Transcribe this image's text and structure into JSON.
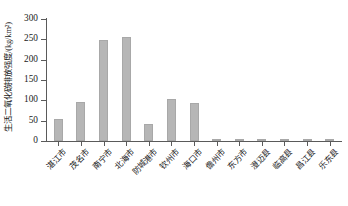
{
  "chart_data": {
    "type": "bar",
    "title": "",
    "xlabel": "",
    "ylabel": "生活二氧化碳排放强度/(kg/km²)",
    "ylim": [
      0,
      300
    ],
    "yticks": [
      0,
      50,
      100,
      150,
      200,
      250,
      300
    ],
    "grid": false,
    "legend": "none",
    "bar_color": "#b6b6b6",
    "axis_color": "#5a5a5a",
    "categories": [
      "湛江市",
      "茂名市",
      "南宁市",
      "北海市",
      "防城港市",
      "钦州市",
      "海口市",
      "儋州市",
      "东方市",
      "澄迈县",
      "临高县",
      "昌江县",
      "乐东县"
    ],
    "values": [
      55,
      95,
      248,
      256,
      42,
      103,
      94,
      5,
      1,
      1,
      1,
      1,
      1
    ]
  }
}
